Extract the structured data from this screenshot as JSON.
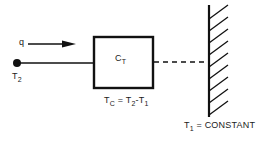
{
  "diagram": {
    "heat_flow_label": "q",
    "source_node": {
      "label": "T",
      "subscript": "2"
    },
    "capacitor": {
      "label": "C",
      "subscript": "T"
    },
    "equation": {
      "parts": [
        "T",
        "C",
        " = T",
        "2",
        "-T",
        "1"
      ]
    },
    "wall": {
      "label": "T",
      "subscript": "1",
      "suffix": " = CONSTANT"
    },
    "colors": {
      "line": "#111111",
      "background": "#ffffff"
    }
  }
}
